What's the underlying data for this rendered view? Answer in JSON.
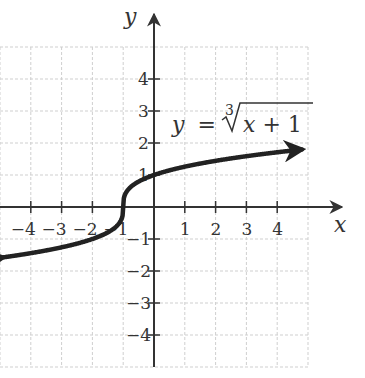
{
  "chart_data": {
    "type": "line",
    "title": "",
    "equation_label": {
      "lhs": "y",
      "equals": "=",
      "root_index": "3",
      "radicand_var": "x",
      "radicand_rest": " + 1"
    },
    "function": "y = cbrt(x + 1)",
    "xlabel": "x",
    "ylabel": "y",
    "xlim": [
      -5,
      5
    ],
    "ylim": [
      -5,
      5
    ],
    "grid": true,
    "x_ticks": [
      -4,
      -3,
      -2,
      -1,
      1,
      2,
      3,
      4
    ],
    "y_ticks": [
      4,
      3,
      2,
      1,
      -1,
      -2,
      -3,
      -4
    ],
    "x_tick_labels": [
      "−4",
      "−3",
      "−2",
      "−1",
      "1",
      "2",
      "3",
      "4"
    ],
    "y_tick_labels": [
      "4",
      "3",
      "2",
      "1",
      "−1",
      "−2",
      "−3",
      "−4"
    ],
    "series": [
      {
        "name": "y = ∛(x + 1)",
        "x": [
          -5,
          -4,
          -3,
          -2,
          -1.5,
          -1.1,
          -1,
          -0.9,
          -0.5,
          0,
          1,
          2,
          3,
          4,
          5
        ],
        "y": [
          -1.587,
          -1.442,
          -1.26,
          -1.0,
          -0.794,
          -0.464,
          0,
          0.464,
          0.794,
          1.0,
          1.26,
          1.442,
          1.587,
          1.71,
          1.817
        ],
        "arrows": "both"
      }
    ]
  }
}
